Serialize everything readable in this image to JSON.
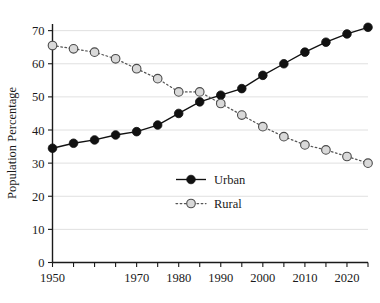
{
  "chart_data": {
    "type": "line",
    "title": "",
    "xlabel": "",
    "ylabel": "Population Percentage",
    "xlim": [
      1950,
      2025
    ],
    "ylim": [
      0,
      72
    ],
    "grid": true,
    "legend_position": "center",
    "x": [
      1950,
      1955,
      1960,
      1965,
      1970,
      1975,
      1980,
      1985,
      1990,
      1995,
      2000,
      2005,
      2010,
      2015,
      2020,
      2025
    ],
    "xticks": [
      1950,
      1955,
      1960,
      1965,
      1970,
      1975,
      1980,
      1985,
      1990,
      1995,
      2000,
      2005,
      2010,
      2015,
      2020,
      2025
    ],
    "xtick_labels": [
      "1950",
      "",
      "",
      "",
      "1970",
      "",
      "1980",
      "",
      "1990",
      "",
      "2000",
      "",
      "2010",
      "",
      "2020",
      ""
    ],
    "yticks": [
      0,
      10,
      20,
      30,
      40,
      50,
      60,
      70
    ],
    "ytick_labels": [
      "0",
      "10",
      "20",
      "30",
      "40",
      "50",
      "60",
      "70"
    ],
    "series": [
      {
        "name": "Urban",
        "marker": "filled-circle",
        "linestyle": "solid",
        "color": "#111111",
        "values": [
          34.5,
          36.0,
          37.0,
          38.5,
          39.5,
          41.5,
          45.0,
          48.5,
          50.5,
          52.5,
          56.5,
          60.0,
          63.5,
          66.5,
          69.0,
          71.0
        ]
      },
      {
        "name": "Rural",
        "marker": "open-circle",
        "linestyle": "dotted",
        "color": "#555555",
        "values": [
          65.5,
          64.5,
          63.5,
          61.5,
          58.5,
          55.5,
          51.5,
          51.5,
          48.0,
          44.5,
          41.0,
          38.0,
          35.5,
          34.0,
          32.0,
          30.0
        ]
      }
    ]
  },
  "legend": {
    "items": [
      {
        "label": "Urban"
      },
      {
        "label": "Rural"
      }
    ]
  },
  "axes": {
    "y_title": "Population Percentage"
  }
}
